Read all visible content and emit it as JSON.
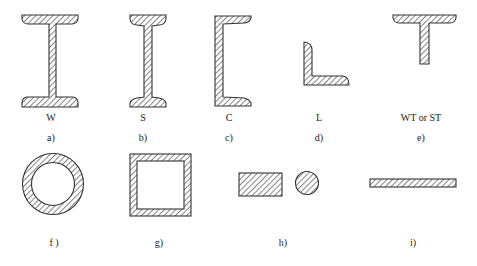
{
  "figure": {
    "sections": [
      {
        "id": "a",
        "name": "W",
        "letter": "a)"
      },
      {
        "id": "b",
        "name": "S",
        "letter": "b)"
      },
      {
        "id": "c",
        "name": "C",
        "letter": "c)"
      },
      {
        "id": "d",
        "name": "L",
        "letter": "d)"
      },
      {
        "id": "e",
        "name": "WT or ST",
        "letter": "e)"
      },
      {
        "id": "f",
        "name": "",
        "letter": "f )"
      },
      {
        "id": "g",
        "name": "",
        "letter": "g)"
      },
      {
        "id": "h",
        "name": "",
        "letter": "h)"
      },
      {
        "id": "i",
        "name": "",
        "letter": "i)"
      }
    ],
    "colors": {
      "stroke": "#333333",
      "hatch": "#444444",
      "background": "#ffffff"
    }
  }
}
